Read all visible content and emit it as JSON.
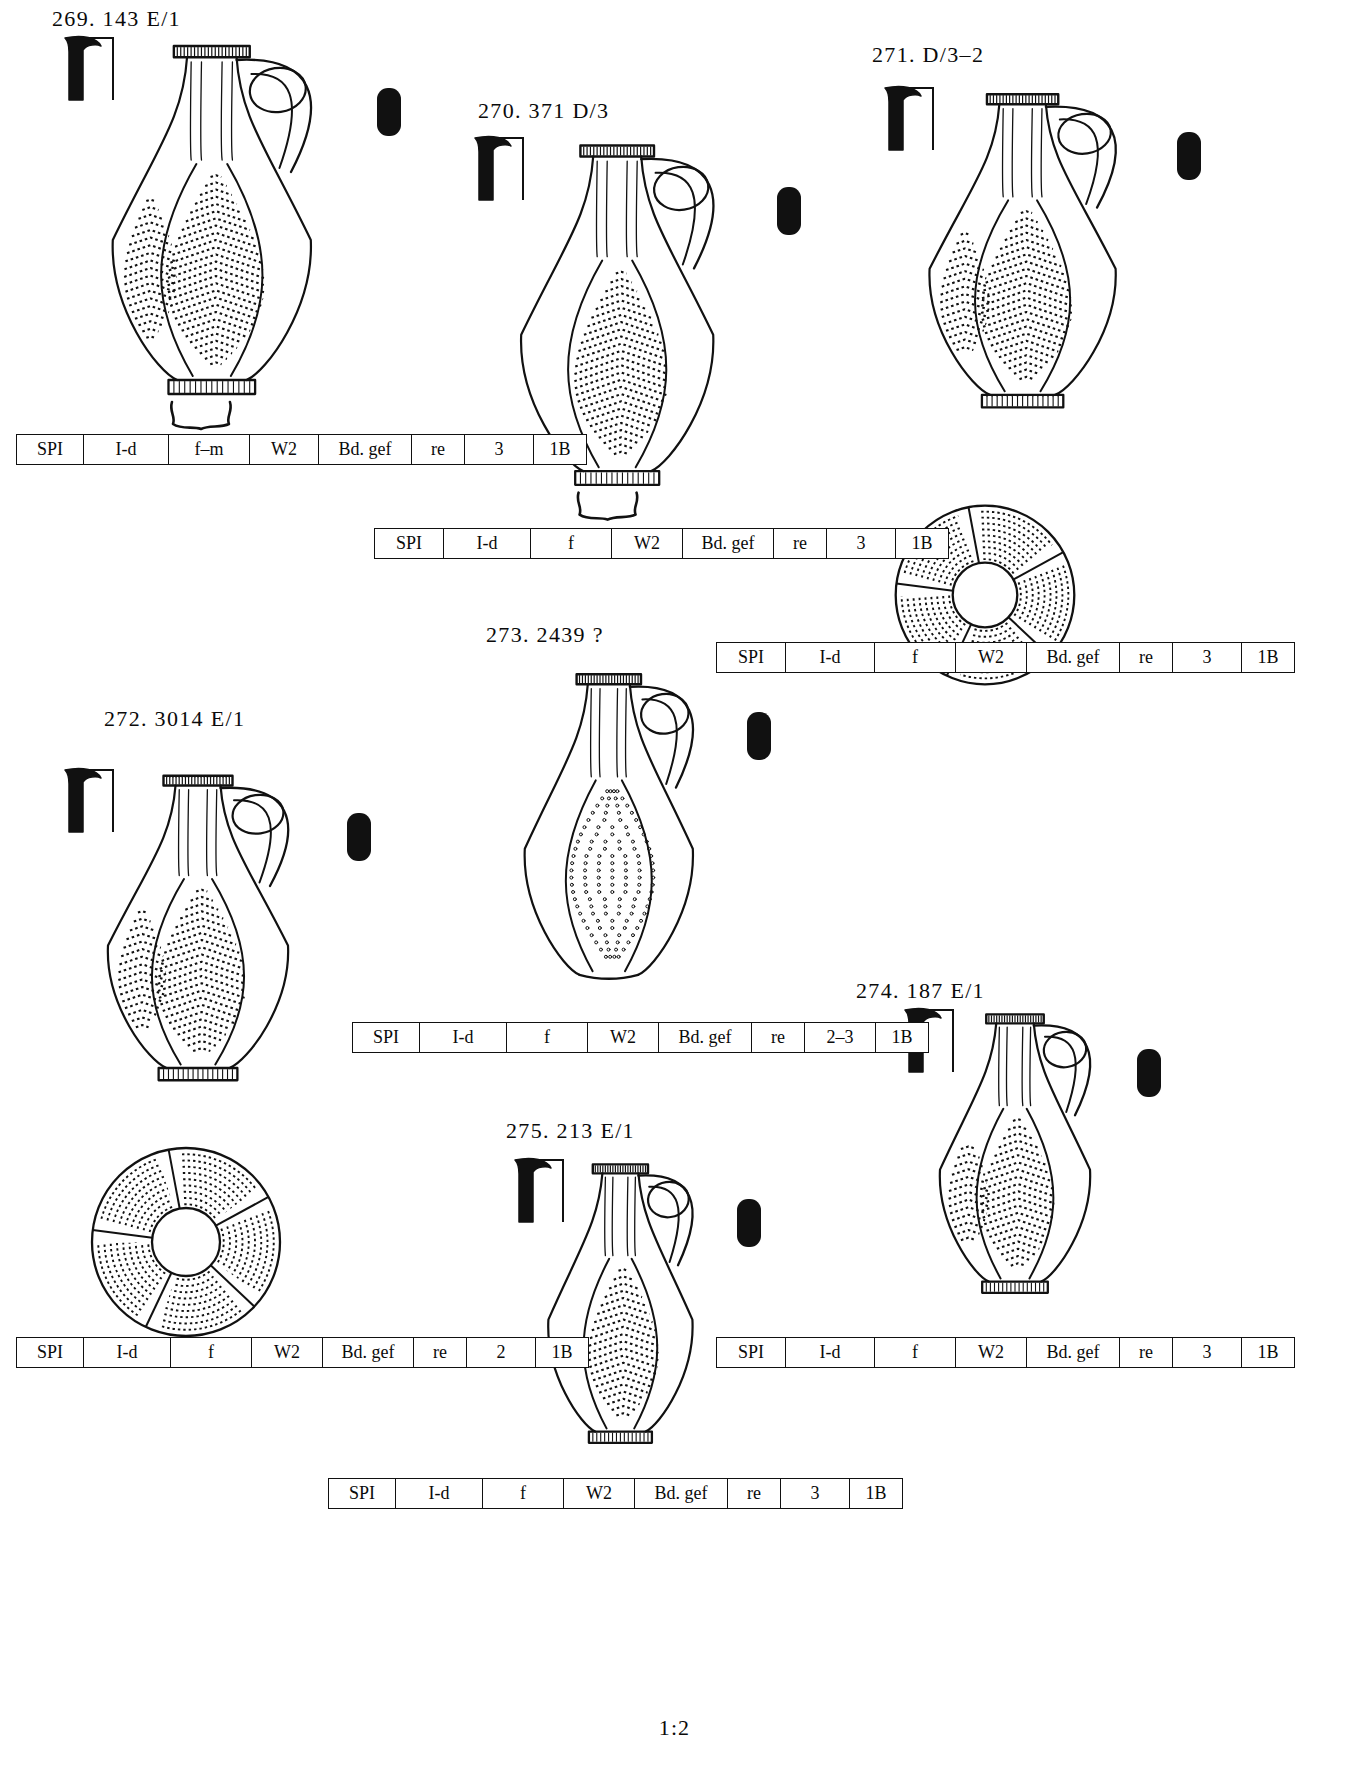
{
  "plate": {
    "scale_note": "1:2",
    "width": 1349,
    "height": 1772,
    "ink_color": "#111111",
    "paper_color": "#ffffff"
  },
  "table_columns": [
    "ware",
    "form",
    "fabric",
    "surface",
    "base",
    "firing",
    "phase",
    "group"
  ],
  "vessels": [
    {
      "id": "269",
      "label": "269.  143  E/1",
      "label_x": 52,
      "label_y": 6,
      "draw_x": 60,
      "draw_y": 28,
      "draw_w": 330,
      "draw_h": 400,
      "has_profile_mark": true,
      "has_section_mark": true,
      "has_base_profile": true,
      "has_top_view": false,
      "decor": "chevron",
      "table_x": 16,
      "table_y": 434,
      "table": [
        "SPI",
        "I-d",
        "f–m",
        "W2",
        "Bd. gef",
        "re",
        "3",
        "1B"
      ],
      "col_widths": [
        58,
        76,
        72,
        60,
        84,
        44,
        60,
        44
      ]
    },
    {
      "id": "270",
      "label": "270.  371  D/3",
      "label_x": 478,
      "label_y": 98,
      "draw_x": 470,
      "draw_y": 128,
      "draw_w": 320,
      "draw_h": 390,
      "has_profile_mark": true,
      "has_section_mark": true,
      "has_base_profile": true,
      "has_top_view": false,
      "decor": "stipple-chevron",
      "table_x": 374,
      "table_y": 528,
      "table": [
        "SPI",
        "I-d",
        "f",
        "W2",
        "Bd. gef",
        "re",
        "3",
        "1B"
      ],
      "col_widths": [
        60,
        78,
        72,
        62,
        82,
        44,
        60,
        44
      ]
    },
    {
      "id": "271",
      "label": "271.  D/3–2",
      "label_x": 872,
      "label_y": 42,
      "draw_x": 880,
      "draw_y": 78,
      "draw_w": 310,
      "draw_h": 360,
      "has_profile_mark": true,
      "has_section_mark": true,
      "has_base_profile": false,
      "has_top_view": true,
      "top_view_x": 890,
      "top_view_y": 500,
      "top_view_size": 190,
      "decor": "leaf-panel",
      "table_x": 716,
      "table_y": 642,
      "table": [
        "SPI",
        "I-d",
        "f",
        "W2",
        "Bd. gef",
        "re",
        "3",
        "1B"
      ],
      "col_widths": [
        60,
        80,
        72,
        62,
        84,
        44,
        60,
        44
      ]
    },
    {
      "id": "272",
      "label": "272.  3014  E/1",
      "label_x": 104,
      "label_y": 706,
      "draw_x": 60,
      "draw_y": 760,
      "draw_w": 300,
      "draw_h": 350,
      "has_profile_mark": true,
      "has_section_mark": true,
      "has_base_profile": false,
      "has_top_view": true,
      "top_view_x": 86,
      "top_view_y": 1142,
      "top_view_size": 200,
      "decor": "chevron",
      "table_x": 16,
      "table_y": 1337,
      "table": [
        "SPI",
        "I-d",
        "f",
        "W2",
        "Bd. gef",
        "re",
        "2",
        "1B"
      ],
      "col_widths": [
        58,
        78,
        72,
        62,
        82,
        44,
        60,
        44
      ]
    },
    {
      "id": "273",
      "label": "273.  2439  ?",
      "label_x": 486,
      "label_y": 622,
      "draw_x": 480,
      "draw_y": 658,
      "draw_w": 280,
      "draw_h": 360,
      "has_profile_mark": false,
      "has_section_mark": true,
      "has_base_profile": false,
      "has_top_view": false,
      "decor": "dots",
      "table_x": 352,
      "table_y": 1022,
      "table": [
        "SPI",
        "I-d",
        "f",
        "W2",
        "Bd. gef",
        "re",
        "2–3",
        "1B"
      ],
      "col_widths": [
        58,
        78,
        72,
        62,
        84,
        44,
        62,
        44
      ]
    },
    {
      "id": "274",
      "label": "274.  187  E/1",
      "label_x": 856,
      "label_y": 978,
      "draw_x": 900,
      "draw_y": 1000,
      "draw_w": 250,
      "draw_h": 320,
      "has_profile_mark": true,
      "has_section_mark": true,
      "has_base_profile": false,
      "has_top_view": false,
      "decor": "chevron",
      "table_x": 716,
      "table_y": 1337,
      "table": [
        "SPI",
        "I-d",
        "f",
        "W2",
        "Bd. gef",
        "re",
        "3",
        "1B"
      ],
      "col_widths": [
        60,
        80,
        72,
        62,
        84,
        44,
        60,
        44
      ]
    },
    {
      "id": "275",
      "label": "275.  213  E/1",
      "label_x": 506,
      "label_y": 1118,
      "draw_x": 510,
      "draw_y": 1150,
      "draw_w": 240,
      "draw_h": 320,
      "has_profile_mark": true,
      "has_section_mark": true,
      "has_base_profile": false,
      "has_top_view": false,
      "decor": "stipple-chevron",
      "table_x": 328,
      "table_y": 1478,
      "table": [
        "SPI",
        "I-d",
        "f",
        "W2",
        "Bd. gef",
        "re",
        "3",
        "1B"
      ],
      "col_widths": [
        58,
        78,
        72,
        62,
        84,
        44,
        60,
        44
      ]
    }
  ]
}
